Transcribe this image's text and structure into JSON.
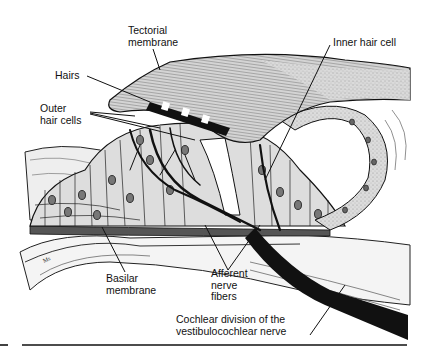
{
  "figure": {
    "labels": {
      "tectorial_membrane": "Tectorial\nmembrane",
      "hairs": "Hairs",
      "outer_hair_cells": "Outer\nhair cells",
      "inner_hair_cell": "Inner hair cell",
      "basilar_membrane": "Basilar\nmembrane",
      "afferent_nerve_fibers": "Afferent\nnerve\nfibers",
      "cochlear_division": "Cochlear division of the\nvestibulocochlear nerve"
    },
    "signature": "Ms",
    "colors": {
      "ink": "#111111",
      "tissue_fill": "#d8d8d8",
      "membrane_fill": "#c9c9c9",
      "background": "#ffffff"
    }
  }
}
